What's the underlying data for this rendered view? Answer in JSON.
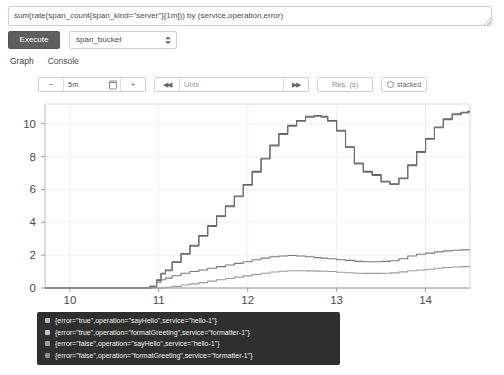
{
  "query": {
    "value": "sum(rate(span_count{span_kind=\"server\"}[1m])) by (service,operation,error)",
    "placeholder": "Expression (press Shift+Enter for newlines)"
  },
  "controls": {
    "execute_label": "Execute",
    "metric_select_value": "span_bucket"
  },
  "tabs": [
    {
      "label": "Graph",
      "active": true
    },
    {
      "label": "Console",
      "active": false
    }
  ],
  "toolbar": {
    "decrease_label": "−",
    "range_value": "5m",
    "calendar_icon": "calendar-icon",
    "increase_label": "+",
    "step_back_label": "◀◀",
    "until_placeholder": "Until",
    "step_forward_label": "▶▶",
    "resolution_placeholder": "Res. (s)",
    "stacked_label": "stacked"
  },
  "chart_data": {
    "type": "line",
    "title": "",
    "xlabel": "",
    "ylabel": "",
    "xlim": [
      9.72,
      14.5
    ],
    "ylim": [
      0,
      11.2
    ],
    "xticks": [
      10,
      11,
      12,
      13,
      14
    ],
    "yticks": [
      0,
      2,
      4,
      6,
      8,
      10
    ],
    "grid": true,
    "legend_position": "below-left",
    "x": [
      9.72,
      9.9,
      10.1,
      10.3,
      10.5,
      10.7,
      10.85,
      10.95,
      11.0,
      11.05,
      11.1,
      11.2,
      11.3,
      11.4,
      11.5,
      11.6,
      11.7,
      11.8,
      11.9,
      12.0,
      12.1,
      12.2,
      12.3,
      12.4,
      12.5,
      12.6,
      12.7,
      12.8,
      12.85,
      12.95,
      13.05,
      13.15,
      13.25,
      13.35,
      13.45,
      13.55,
      13.65,
      13.75,
      13.85,
      13.95,
      14.05,
      14.15,
      14.25,
      14.35,
      14.45,
      14.5
    ],
    "series": [
      {
        "name": "{error=\"true\",operation=\"sayHello\",service=\"hello-1\"}",
        "color": "#5e5e5e",
        "values": [
          0,
          0,
          0,
          0,
          0,
          0,
          0,
          0.1,
          0.5,
          0.9,
          1.1,
          1.6,
          2.1,
          2.6,
          3.2,
          3.8,
          4.4,
          5.0,
          5.6,
          6.3,
          7.1,
          7.9,
          8.7,
          9.4,
          9.9,
          10.2,
          10.45,
          10.5,
          10.45,
          10.2,
          9.6,
          8.6,
          7.6,
          7.1,
          6.9,
          6.5,
          6.35,
          6.7,
          7.5,
          8.3,
          9.1,
          9.8,
          10.3,
          10.6,
          10.7,
          10.75
        ]
      },
      {
        "name": "{error=\"true\",operation=\"formatGreeting\",service=\"formatter-1\"}",
        "color": "#6e6e6e",
        "values": [
          0,
          0,
          0,
          0,
          0,
          0,
          0,
          0.1,
          0.45,
          0.85,
          1.05,
          1.55,
          2.05,
          2.55,
          3.15,
          3.75,
          4.35,
          4.95,
          5.55,
          6.25,
          7.05,
          7.85,
          8.65,
          9.35,
          9.85,
          10.15,
          10.4,
          10.45,
          10.4,
          10.15,
          9.55,
          8.55,
          7.55,
          7.05,
          6.85,
          6.45,
          6.3,
          6.65,
          7.45,
          8.25,
          9.05,
          9.75,
          10.25,
          10.55,
          10.65,
          10.7
        ]
      },
      {
        "name": "{error=\"false\",operation=\"sayHello\",service=\"hello-1\"}",
        "color": "#7a7a7a",
        "values": [
          0,
          0,
          0,
          0,
          0,
          0,
          0,
          0.05,
          0.35,
          0.5,
          0.6,
          0.75,
          0.9,
          1.0,
          1.1,
          1.2,
          1.3,
          1.4,
          1.5,
          1.6,
          1.72,
          1.82,
          1.9,
          1.95,
          1.98,
          1.95,
          1.9,
          1.85,
          1.82,
          1.78,
          1.72,
          1.68,
          1.62,
          1.6,
          1.6,
          1.62,
          1.66,
          1.78,
          1.95,
          2.05,
          2.12,
          2.2,
          2.26,
          2.3,
          2.32,
          2.33
        ]
      },
      {
        "name": "{error=\"false\",operation=\"formatGreeting\",service=\"formatter-1\"}",
        "color": "#9a9a9a",
        "values": [
          0,
          0,
          0,
          0,
          0,
          0,
          0,
          0,
          0,
          0,
          0.05,
          0.1,
          0.18,
          0.25,
          0.33,
          0.42,
          0.5,
          0.58,
          0.66,
          0.74,
          0.82,
          0.9,
          0.97,
          1.02,
          1.05,
          1.05,
          1.04,
          1.03,
          1.02,
          1.0,
          0.96,
          0.93,
          0.9,
          0.89,
          0.89,
          0.9,
          0.92,
          0.98,
          1.05,
          1.1,
          1.14,
          1.2,
          1.25,
          1.28,
          1.3,
          1.31
        ]
      }
    ]
  },
  "legend": [
    {
      "label": "{error=\"true\",operation=\"sayHello\",service=\"hello-1\"}",
      "color": "#b9b9b9"
    },
    {
      "label": "{error=\"true\",operation=\"formatGreeting\",service=\"formatter-1\"}",
      "color": "#c4c4c4"
    },
    {
      "label": "{error=\"false\",operation=\"sayHello\",service=\"hello-1\"}",
      "color": "#9d9d9d"
    },
    {
      "label": "{error=\"false\",operation=\"formatGreeting\",service=\"formatter-1\"}",
      "color": "#8f8f8f"
    }
  ]
}
